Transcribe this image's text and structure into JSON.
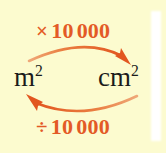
{
  "diagram": {
    "type": "unit-conversion-loop",
    "background_color": "#fcfbcf",
    "accent_color": "#e35a26",
    "arrow_color": "#e8763a",
    "text_color": "#1b1b1b",
    "units": {
      "left": {
        "base": "m",
        "exponent": "2",
        "full": "m2"
      },
      "right": {
        "base": "cm",
        "exponent": "2",
        "full": "cm2"
      }
    },
    "operations": {
      "top": {
        "sign": "×",
        "value": "10",
        "value_tail": "000",
        "full": "× 10 000",
        "direction": "left-to-right"
      },
      "bottom": {
        "sign": "÷",
        "value": "10",
        "value_tail": "000",
        "full": "÷ 10 000",
        "direction": "right-to-left"
      }
    },
    "arrows": [
      {
        "name": "top-arrow",
        "from": "m2",
        "to": "cm2",
        "points": "right"
      },
      {
        "name": "bottom-arrow",
        "from": "cm2",
        "to": "m2",
        "points": "left"
      }
    ]
  }
}
